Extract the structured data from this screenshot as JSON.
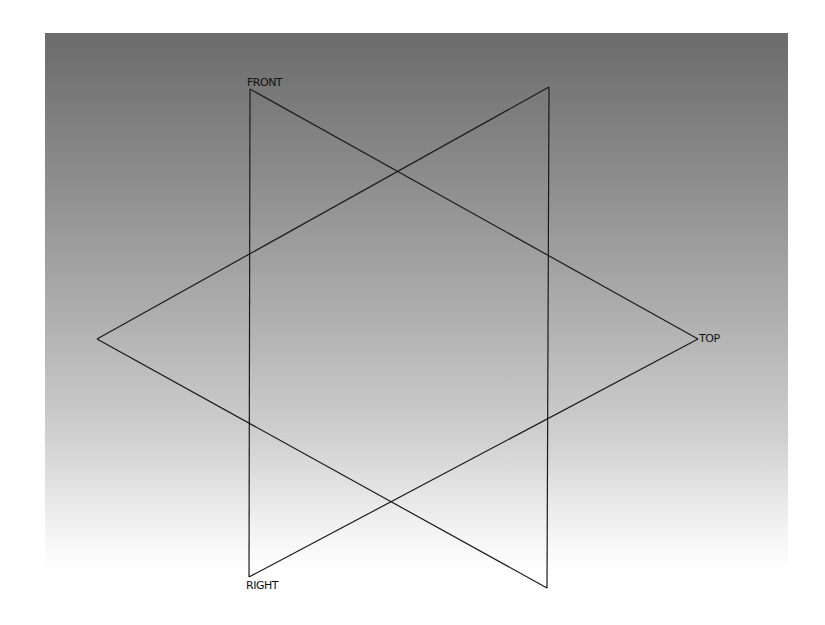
{
  "viewport": {
    "background": "vertical gray gradient (dark top to white bottom)",
    "colors": {
      "top": "#6b6b6b",
      "bottom": "#ffffff",
      "line": "#1a1a1a"
    }
  },
  "planes": [
    {
      "name": "FRONT",
      "label": "FRONT",
      "points": [
        [
          250,
          89
        ],
        [
          698,
          339
        ],
        [
          250,
          577
        ]
      ]
    },
    {
      "name": "TOP",
      "label": "TOP",
      "points": [
        [
          97,
          339
        ],
        [
          549,
          87
        ],
        [
          547,
          588
        ]
      ]
    },
    {
      "name": "RIGHT",
      "label": "RIGHT",
      "points": [
        [
          249,
          577
        ],
        [
          698,
          339
        ]
      ]
    }
  ],
  "labels": {
    "front": "FRONT",
    "top": "TOP",
    "right": "RIGHT"
  }
}
